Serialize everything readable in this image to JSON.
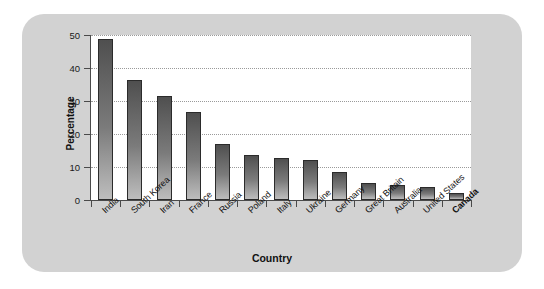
{
  "chart_data": {
    "type": "bar",
    "title": "",
    "xlabel": "Country",
    "ylabel": "Percentage",
    "categories": [
      "India",
      "South Korea",
      "Iran",
      "France",
      "Russia",
      "Poland",
      "Italy",
      "Ukraine",
      "Germany",
      "Great Britain",
      "Australia",
      "United States",
      "Canada"
    ],
    "values": [
      48.8,
      36.4,
      31.5,
      26.8,
      17.0,
      13.5,
      12.8,
      12.0,
      8.5,
      5.3,
      4.7,
      4.0,
      2.2
    ],
    "ylim": [
      0,
      50
    ],
    "yticks": [
      0,
      10,
      20,
      30,
      40,
      50
    ],
    "ytick_labels": [
      "0",
      "10",
      "20",
      "30",
      "40",
      "50"
    ],
    "grid": true,
    "legend": "none",
    "highlighted_category": "Canada",
    "bar_color_top": "#4f4f4f",
    "bar_color_bottom": "#bdbdbd",
    "panel_color": "#d2d2d2",
    "plot_background": "#ffffff"
  }
}
